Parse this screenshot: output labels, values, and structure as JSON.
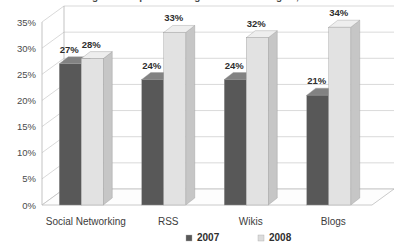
{
  "chart_data": {
    "type": "bar",
    "title": "Percentage of companies using social technologies, 2007-2008",
    "xlabel": "",
    "ylabel": "",
    "ylim": [
      0,
      35
    ],
    "ytick_labels": [
      "0%",
      "5%",
      "10%",
      "15%",
      "20%",
      "25%",
      "30%",
      "35%"
    ],
    "ytick_values": [
      0,
      5,
      10,
      15,
      20,
      25,
      30,
      35
    ],
    "grid": true,
    "legend_position": "bottom",
    "categories": [
      "Social Networking",
      "RSS",
      "Wikis",
      "Blogs"
    ],
    "series": [
      {
        "name": "2007",
        "color": "#585858",
        "values": [
          27,
          24,
          24,
          21
        ],
        "labels": [
          "27%",
          "24%",
          "24%",
          "21%"
        ]
      },
      {
        "name": "2008",
        "color": "#e2e2e2",
        "values": [
          28,
          33,
          32,
          34
        ],
        "labels": [
          "28%",
          "33%",
          "32%",
          "34%"
        ]
      }
    ]
  },
  "legend": {
    "items": [
      {
        "label": "2007",
        "swatch": "#585858"
      },
      {
        "label": "2008",
        "swatch": "#dcdcdc"
      }
    ]
  }
}
